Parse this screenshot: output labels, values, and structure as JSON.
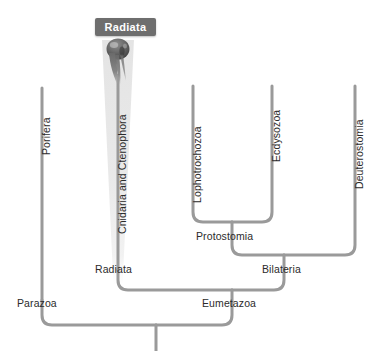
{
  "diagram": {
    "callout": {
      "label": "Radiata"
    },
    "colors": {
      "branch": "#9a9a9a",
      "branch_shadow": "#c9c9c9",
      "callout_bg": "#6e6e6e",
      "callout_text": "#ffffff",
      "label_text": "#2b2b2b",
      "highlight_band": "#e8e8e8",
      "background": "#ffffff"
    },
    "terminal_taxa": [
      {
        "id": "porifera",
        "label": "Porifera"
      },
      {
        "id": "cnidaria",
        "label": "Cnidaria and Ctenophora"
      },
      {
        "id": "lophotrochozoa",
        "label": "Lophotrochozoa"
      },
      {
        "id": "ecdysozoa",
        "label": "Ecdysozoa"
      },
      {
        "id": "deuterostomia",
        "label": "Deuterostomia"
      }
    ],
    "internal_nodes": [
      {
        "id": "radiata",
        "label": "Radiata"
      },
      {
        "id": "protostomia",
        "label": "Protostomia"
      },
      {
        "id": "bilateria",
        "label": "Bilateria"
      },
      {
        "id": "parazoa",
        "label": "Parazoa"
      },
      {
        "id": "eumetazoa",
        "label": "Eumetazoa"
      }
    ],
    "organism_image": {
      "name": "ctenophore-photo",
      "described_as": "comb jelly"
    }
  }
}
